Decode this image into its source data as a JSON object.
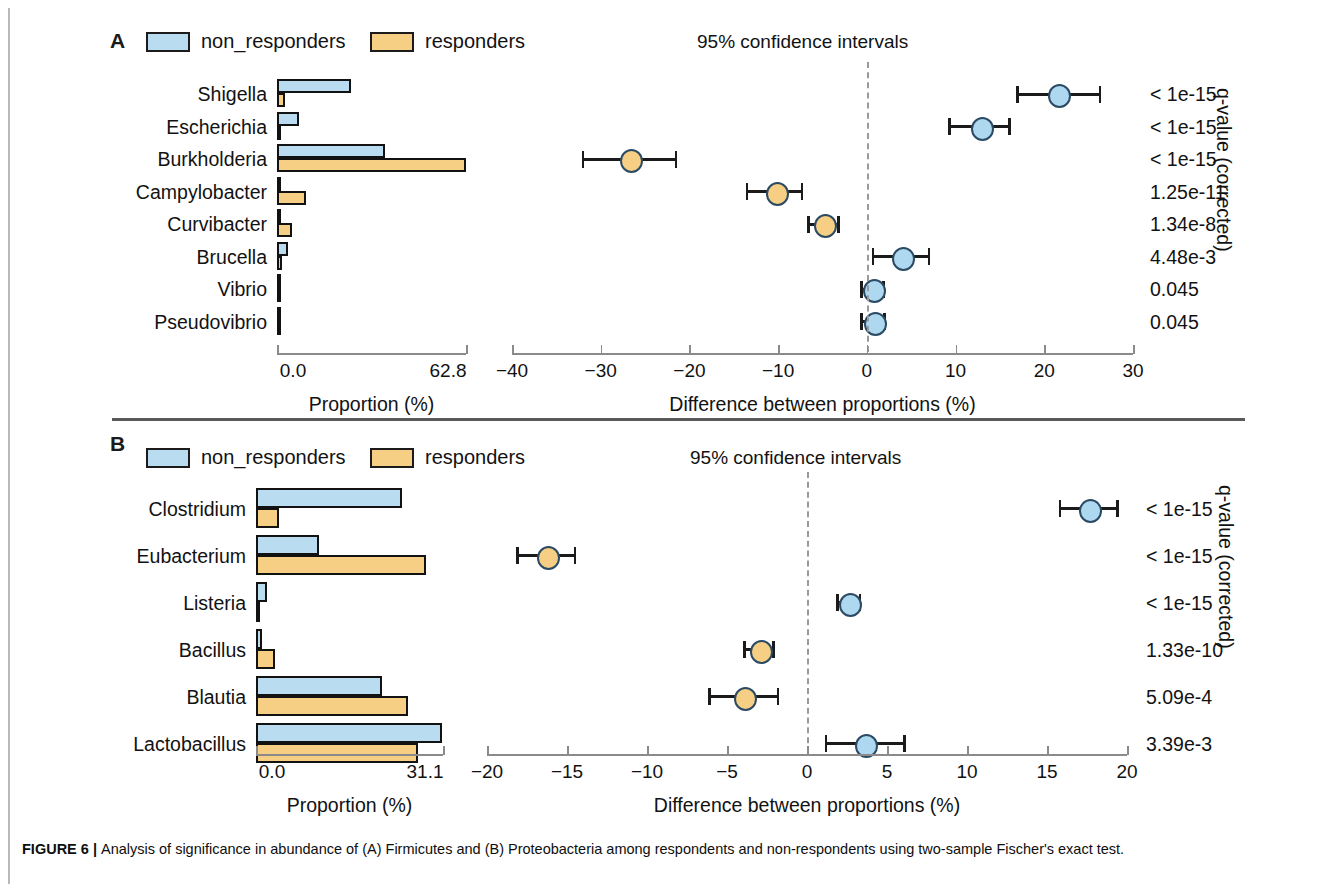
{
  "figure": {
    "caption_bold": "FIGURE 6 | ",
    "caption_text": "Analysis of significance in abundance of (A) Firmicutes and (B) Proteobacteria among respondents and non-respondents using two-sample Fischer's exact test."
  },
  "colors": {
    "non_responders": "#b9dcf0",
    "responders": "#f6cf84",
    "outline": "#121212",
    "zero_line": "#9a9a9a"
  },
  "legend": {
    "non_responders": "non_responders",
    "responders": "responders",
    "ci_title": "95% confidence intervals"
  },
  "axis_titles": {
    "proportion": "Proportion (%)",
    "difference": "Difference between proportions (%)",
    "qvalue": "q-value (corrected)"
  },
  "chart_data": [
    {
      "type": "bar",
      "panel": "A",
      "panel_letter": "A",
      "title": "95% confidence intervals",
      "categories": [
        "Shigella",
        "Escherichia",
        "Burkholderia",
        "Campylobacter",
        "Curvibacter",
        "Brucella",
        "Vibrio",
        "Pseudovibrio"
      ],
      "series": [
        {
          "name": "non_responders",
          "values": [
            24.5,
            7.2,
            36.0,
            1.2,
            0.0,
            3.5,
            0.5,
            0.6
          ]
        },
        {
          "name": "responders",
          "values": [
            2.8,
            0.0,
            62.8,
            9.8,
            4.9,
            1.6,
            0.0,
            0.0
          ]
        }
      ],
      "xlabel": "Proportion (%)",
      "ylabel": "",
      "proportion_axis": {
        "ticks": [
          "0.0",
          "62.8"
        ],
        "min": 0.0,
        "max": 62.8
      },
      "difference_axis": {
        "label": "Difference between proportions (%)",
        "ticks": [
          -40,
          -30,
          -20,
          -10,
          0,
          10,
          20,
          30
        ],
        "tick_labels": [
          "−40",
          "−30",
          "−20",
          "−10",
          "0",
          "10",
          "20",
          "30"
        ],
        "min": -40,
        "max": 30
      },
      "confidence_intervals": [
        {
          "category": "Shigella",
          "mean": 21.5,
          "low": 17.0,
          "high": 26.3,
          "color": "non_responders",
          "qvalue": "< 1e-15"
        },
        {
          "category": "Escherichia",
          "mean": 12.8,
          "low": 9.3,
          "high": 16.1,
          "color": "non_responders",
          "qvalue": "< 1e-15"
        },
        {
          "category": "Burkholderia",
          "mean": -26.8,
          "low": -32.0,
          "high": -21.5,
          "color": "responders",
          "qvalue": "< 1e-15"
        },
        {
          "category": "Campylobacter",
          "mean": -10.3,
          "low": -13.5,
          "high": -7.3,
          "color": "responders",
          "qvalue": "1.25e-11"
        },
        {
          "category": "Curvibacter",
          "mean": -4.9,
          "low": -6.6,
          "high": -3.2,
          "color": "responders",
          "qvalue": "1.34e-8"
        },
        {
          "category": "Brucella",
          "mean": 3.9,
          "low": 0.7,
          "high": 7.0,
          "color": "non_responders",
          "qvalue": "4.48e-3"
        },
        {
          "category": "Vibrio",
          "mean": 0.6,
          "low": -0.6,
          "high": 1.9,
          "color": "non_responders",
          "qvalue": "0.045"
        },
        {
          "category": "Pseudovibrio",
          "mean": 0.7,
          "low": -0.6,
          "high": 2.0,
          "color": "non_responders",
          "qvalue": "0.045"
        }
      ],
      "qvalue_axis_label": "q-value (corrected)"
    },
    {
      "type": "bar",
      "panel": "B",
      "panel_letter": "B",
      "title": "95% confidence intervals",
      "categories": [
        "Clostridium",
        "Eubacterium",
        "Listeria",
        "Bacillus",
        "Blautia",
        "Lactobacillus"
      ],
      "series": [
        {
          "name": "non_responders",
          "values": [
            24.2,
            10.5,
            1.8,
            1.0,
            21.0,
            30.9
          ]
        },
        {
          "name": "responders",
          "values": [
            3.9,
            28.3,
            0.0,
            3.2,
            25.2,
            27.0
          ]
        }
      ],
      "xlabel": "Proportion (%)",
      "ylabel": "",
      "proportion_axis": {
        "ticks": [
          "0.0",
          "31.1"
        ],
        "min": 0.0,
        "max": 31.1
      },
      "difference_axis": {
        "label": "Difference between proportions (%)",
        "ticks": [
          -20,
          -15,
          -10,
          -5,
          0,
          5,
          10,
          15,
          20
        ],
        "tick_labels": [
          "−20",
          "−15",
          "−10",
          "−5",
          "0",
          "5",
          "10",
          "15",
          "20"
        ],
        "min": -20,
        "max": 20
      },
      "confidence_intervals": [
        {
          "category": "Clostridium",
          "mean": 17.6,
          "low": 15.8,
          "high": 19.4,
          "color": "non_responders",
          "qvalue": "< 1e-15"
        },
        {
          "category": "Eubacterium",
          "mean": -16.3,
          "low": -18.1,
          "high": -14.5,
          "color": "responders",
          "qvalue": "< 1e-15"
        },
        {
          "category": "Listeria",
          "mean": 2.6,
          "low": 1.9,
          "high": 3.3,
          "color": "non_responders",
          "qvalue": "< 1e-15"
        },
        {
          "category": "Bacillus",
          "mean": -3.0,
          "low": -3.9,
          "high": -2.1,
          "color": "responders",
          "qvalue": "1.33e-10"
        },
        {
          "category": "Blautia",
          "mean": -4.0,
          "low": -6.1,
          "high": -1.8,
          "color": "responders",
          "qvalue": "5.09e-4"
        },
        {
          "category": "Lactobacillus",
          "mean": 3.6,
          "low": 1.2,
          "high": 6.1,
          "color": "non_responders",
          "qvalue": "3.39e-3"
        }
      ],
      "qvalue_axis_label": "q-value (corrected)"
    }
  ]
}
